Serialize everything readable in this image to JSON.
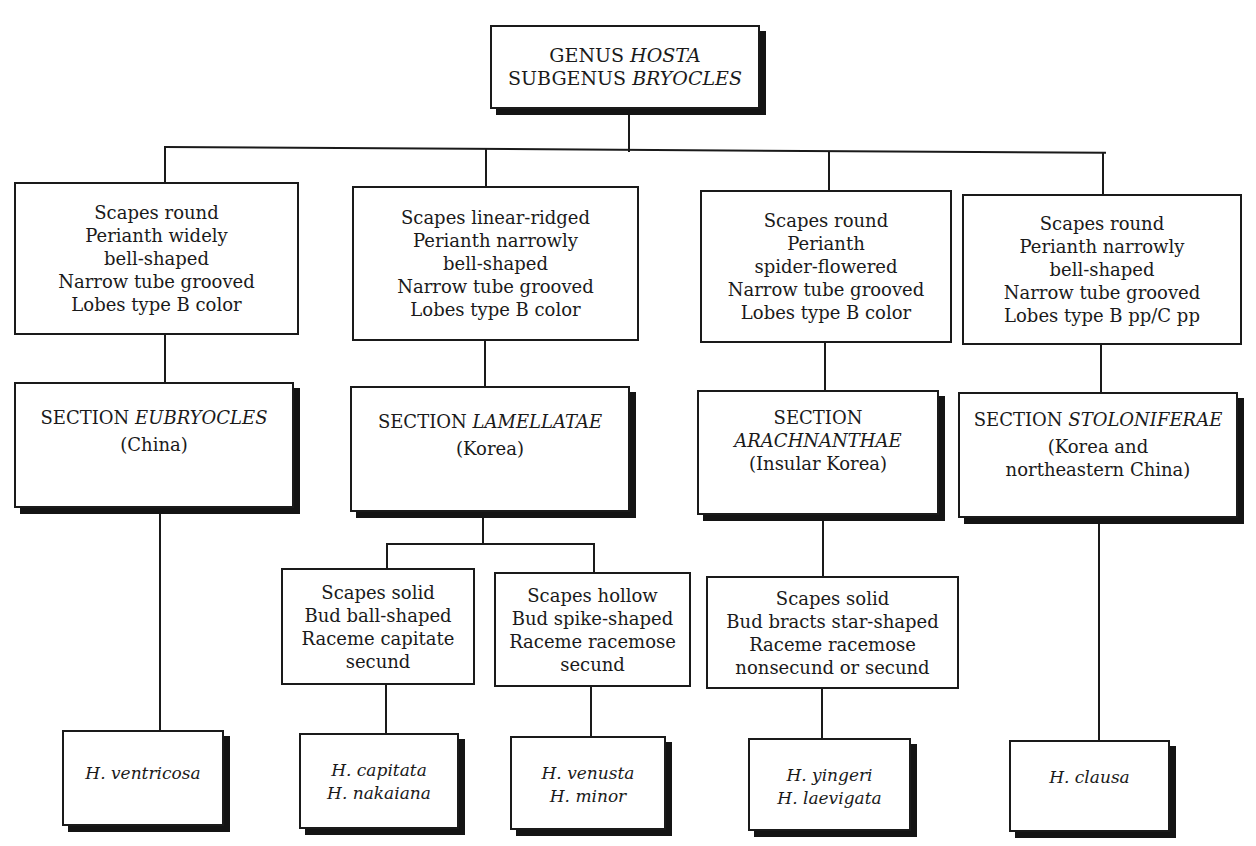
{
  "diagram": {
    "root": {
      "line1_prefix": "GENUS",
      "line1_name": "HOSTA",
      "line2_prefix": "SUBGENUS",
      "line2_name": "BRYOCLES"
    },
    "characters": [
      {
        "lines": [
          "Scapes round",
          "Perianth widely",
          "bell-shaped",
          "Narrow tube grooved",
          "Lobes type B color"
        ]
      },
      {
        "lines": [
          "Scapes linear-ridged",
          "Perianth narrowly",
          "bell-shaped",
          "Narrow tube grooved",
          "Lobes type B color"
        ]
      },
      {
        "lines": [
          "Scapes round",
          "Perianth",
          "spider-flowered",
          "Narrow tube grooved",
          "Lobes type B color"
        ]
      },
      {
        "lines": [
          "Scapes round",
          "Perianth narrowly",
          "bell-shaped",
          "Narrow tube grooved",
          "Lobes type B pp/C pp"
        ]
      }
    ],
    "sections": [
      {
        "prefix": "SECTION",
        "name": "EUBRYOCLES",
        "region_lines": [
          "(China)"
        ]
      },
      {
        "prefix": "SECTION",
        "name": "LAMELLATAE",
        "region_lines": [
          "(Korea)"
        ]
      },
      {
        "prefix": "SECTION",
        "name": "ARACHNANTHAE",
        "region_lines": [
          "(Insular Korea)"
        ]
      },
      {
        "prefix": "SECTION",
        "name": "STOLONIFERAE",
        "region_lines": [
          "(Korea and",
          "northeastern China)"
        ]
      }
    ],
    "subcharacters": [
      {
        "lines": [
          "Scapes solid",
          "Bud ball-shaped",
          "Raceme capitate",
          "secund"
        ]
      },
      {
        "lines": [
          "Scapes hollow",
          "Bud spike-shaped",
          "Raceme racemose",
          "secund"
        ]
      },
      {
        "lines": [
          "Scapes solid",
          "Bud bracts star-shaped",
          "Raceme racemose",
          "nonsecund or secund"
        ]
      }
    ],
    "species": [
      {
        "lines": [
          "H. ventricosa"
        ]
      },
      {
        "lines": [
          "H. capitata",
          "H. nakaiana"
        ]
      },
      {
        "lines": [
          "H. venusta",
          "H. minor"
        ]
      },
      {
        "lines": [
          "H. yingeri",
          "H. laevigata"
        ]
      },
      {
        "lines": [
          "H. clausa"
        ]
      }
    ]
  }
}
